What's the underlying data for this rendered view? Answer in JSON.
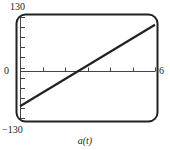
{
  "chart_data": {
    "type": "line",
    "title": "",
    "xlabel": "a(t)",
    "ylabel": "",
    "xlim": [
      0,
      6
    ],
    "ylim": [
      -130,
      130
    ],
    "x_tick_labels": [
      "0",
      "6"
    ],
    "y_tick_labels": [
      "130",
      "-130"
    ],
    "x_ticks": [
      0,
      1,
      2,
      3,
      4,
      5,
      6
    ],
    "y_ticks": [
      -130,
      -104,
      -78,
      -52,
      -26,
      0,
      26,
      52,
      78,
      104,
      130
    ],
    "grid": false,
    "legend": null,
    "series": [
      {
        "name": "a(t)",
        "x": [
          0,
          6
        ],
        "y": [
          -100,
          110
        ]
      }
    ],
    "frame": "rounded-rectangle"
  },
  "labels": {
    "ymax": "130",
    "ymin": "−130",
    "xmin": "0",
    "xmax": "6",
    "xlabel": "a(t)"
  }
}
